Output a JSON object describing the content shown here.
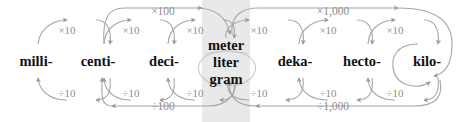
{
  "diagram": {
    "arc_color": "#a6a6a6",
    "label_color": "#8d8d8d",
    "term_color": "#111111",
    "highlight_color": "#e9e9e9",
    "background_color": "#ffffff"
  },
  "terms": [
    {
      "id": "milli",
      "label": "milli-",
      "x": 36
    },
    {
      "id": "centi",
      "label": "centi-",
      "x": 98
    },
    {
      "id": "deci",
      "label": "deci-",
      "x": 164
    },
    {
      "id": "base",
      "label": "meter liter gram",
      "x": 226
    },
    {
      "id": "deka",
      "label": "deka-",
      "x": 295
    },
    {
      "id": "hecto",
      "label": "hecto-",
      "x": 362
    },
    {
      "id": "kilo",
      "label": "kilo-",
      "x": 427
    }
  ],
  "base_unit": {
    "line1": "meter",
    "line2": "liter",
    "line3": "gram"
  },
  "multiply_labels": [
    {
      "id": "milli-to-centi",
      "text": "×10",
      "x": 67,
      "y": 25
    },
    {
      "id": "centi-to-deci",
      "text": "×10",
      "x": 131,
      "y": 25
    },
    {
      "id": "deci-to-base",
      "text": "×10",
      "x": 195,
      "y": 25
    },
    {
      "id": "base-to-deka",
      "text": "×10",
      "x": 259,
      "y": 25
    },
    {
      "id": "deka-to-hecto",
      "text": "×10",
      "x": 328,
      "y": 25
    },
    {
      "id": "hecto-to-kilo",
      "text": "×10",
      "x": 395,
      "y": 25
    },
    {
      "id": "centi-to-base",
      "text": "×100",
      "x": 163,
      "y": 7
    },
    {
      "id": "base-to-kilo",
      "text": "×1,000",
      "x": 333,
      "y": 7
    }
  ],
  "divide_labels": [
    {
      "id": "centi-to-milli",
      "text": "÷10",
      "x": 67,
      "y": 88
    },
    {
      "id": "deci-to-centi",
      "text": "÷10",
      "x": 131,
      "y": 88
    },
    {
      "id": "base-to-deci",
      "text": "÷10",
      "x": 195,
      "y": 88
    },
    {
      "id": "deka-to-base",
      "text": "÷10",
      "x": 259,
      "y": 88
    },
    {
      "id": "hecto-to-deka",
      "text": "÷10",
      "x": 328,
      "y": 88
    },
    {
      "id": "kilo-to-hecto",
      "text": "÷10",
      "x": 395,
      "y": 88
    },
    {
      "id": "base-to-centi",
      "text": "÷100",
      "x": 163,
      "y": 103
    },
    {
      "id": "kilo-to-base",
      "text": "÷1,000",
      "x": 333,
      "y": 103
    }
  ]
}
